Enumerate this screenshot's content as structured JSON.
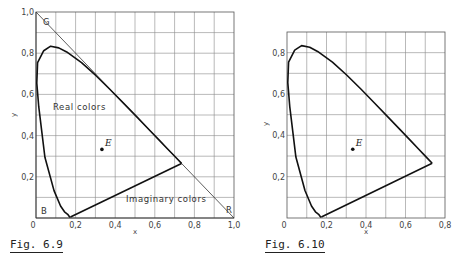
{
  "chart_data": [
    {
      "type": "line",
      "title": "",
      "caption": "Fig. 6.9",
      "xlabel": "x",
      "ylabel": "y",
      "xlim": [
        0,
        1.0
      ],
      "ylim": [
        0,
        1.0
      ],
      "grid": true,
      "x_ticks": [
        "0",
        "0.2",
        "0.4",
        "0.6",
        "0.8",
        "1.0"
      ],
      "y_ticks": [
        "0.2",
        "0.4",
        "0.6",
        "0.8",
        "1.0"
      ],
      "series": [
        {
          "name": "spectral locus",
          "x": [
            0.174,
            0.17,
            0.16,
            0.144,
            0.124,
            0.091,
            0.045,
            0.014,
            0.004,
            0.008,
            0.039,
            0.074,
            0.115,
            0.155,
            0.23,
            0.302,
            0.374,
            0.444,
            0.513,
            0.575,
            0.627,
            0.666,
            0.692,
            0.715,
            0.735
          ],
          "y": [
            0.005,
            0.005,
            0.018,
            0.03,
            0.058,
            0.133,
            0.295,
            0.539,
            0.655,
            0.754,
            0.812,
            0.834,
            0.826,
            0.806,
            0.754,
            0.692,
            0.624,
            0.555,
            0.487,
            0.425,
            0.373,
            0.334,
            0.308,
            0.285,
            0.265
          ]
        },
        {
          "name": "purple line",
          "x": [
            0.174,
            0.735
          ],
          "y": [
            0.005,
            0.265
          ]
        },
        {
          "name": "primary triangle",
          "x": [
            0.0,
            1.0,
            0.0,
            0.0
          ],
          "y": [
            1.0,
            0.0,
            0.0,
            1.0
          ]
        }
      ],
      "points": [
        {
          "label": "E",
          "x": 0.333,
          "y": 0.333
        }
      ],
      "annotations": [
        {
          "text": "G",
          "x": 0.04,
          "y": 0.97
        },
        {
          "text": "B",
          "x": 0.03,
          "y": 0.03
        },
        {
          "text": "R",
          "x": 0.97,
          "y": 0.03
        },
        {
          "text": "Real colors",
          "x": 0.09,
          "y": 0.55
        },
        {
          "text": "Imaginary colors",
          "x": 0.46,
          "y": 0.08
        }
      ]
    },
    {
      "type": "line",
      "title": "",
      "caption": "Fig. 6.10",
      "xlabel": "x",
      "ylabel": "y",
      "xlim": [
        0,
        0.8
      ],
      "ylim": [
        0,
        0.9
      ],
      "grid": true,
      "x_ticks": [
        "0",
        "0.2",
        "0.4",
        "0.6",
        "0.8"
      ],
      "y_ticks": [
        "0.2",
        "0.4",
        "0.6",
        "0.8"
      ],
      "series": [
        {
          "name": "spectral locus",
          "x": [
            0.174,
            0.17,
            0.16,
            0.144,
            0.124,
            0.091,
            0.045,
            0.014,
            0.004,
            0.008,
            0.039,
            0.074,
            0.115,
            0.155,
            0.23,
            0.302,
            0.374,
            0.444,
            0.513,
            0.575,
            0.627,
            0.666,
            0.692,
            0.715,
            0.735
          ],
          "y": [
            0.005,
            0.005,
            0.018,
            0.03,
            0.058,
            0.133,
            0.295,
            0.539,
            0.655,
            0.754,
            0.812,
            0.834,
            0.826,
            0.806,
            0.754,
            0.692,
            0.624,
            0.555,
            0.487,
            0.425,
            0.373,
            0.334,
            0.308,
            0.285,
            0.265
          ]
        },
        {
          "name": "purple line",
          "x": [
            0.174,
            0.735
          ],
          "y": [
            0.005,
            0.265
          ]
        }
      ],
      "points": [
        {
          "label": "E",
          "x": 0.333,
          "y": 0.333
        }
      ]
    }
  ],
  "fig1": {
    "caption": "Fig. 6.9",
    "xlabel": "x",
    "ylabel": "y",
    "x_ticks": [
      "0",
      "0,2",
      "0,4",
      "0,6",
      "0,8",
      "1,0"
    ],
    "y_ticks": [
      "0,2",
      "0,4",
      "0,6",
      "0,8",
      "1,0"
    ],
    "labels": {
      "g": "G",
      "b": "B",
      "r": "R",
      "e": "E",
      "real": "Real colors",
      "imaginary": "Imaginary colors"
    }
  },
  "fig2": {
    "caption": "Fig. 6.10",
    "xlabel": "x",
    "ylabel": "y",
    "x_ticks": [
      "0",
      "0,2",
      "0,4",
      "0,6",
      "0,8"
    ],
    "y_ticks": [
      "0,2",
      "0,4",
      "0,6",
      "0,8"
    ],
    "labels": {
      "e": "E"
    }
  }
}
